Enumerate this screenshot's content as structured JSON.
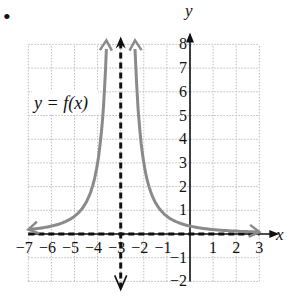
{
  "bullet": "•",
  "chart_data": {
    "type": "line",
    "title": "",
    "function_label": "y = f(x)",
    "xlabel": "x",
    "ylabel": "y",
    "xlim": [
      -7,
      3
    ],
    "ylim": [
      -2,
      8
    ],
    "grid": true,
    "x_ticks": [
      -7,
      -6,
      -5,
      -4,
      -3,
      -2,
      -1,
      1,
      2,
      3
    ],
    "y_ticks": [
      -2,
      -1,
      1,
      2,
      3,
      4,
      5,
      6,
      7,
      8
    ],
    "x_tick_labels": [
      "−7",
      "−6",
      "−5",
      "−4",
      "−3",
      "−2",
      "−1",
      "1",
      "2",
      "3"
    ],
    "y_tick_labels": [
      "−2",
      "−1",
      "1",
      "2",
      "3",
      "4",
      "5",
      "6",
      "7",
      "8"
    ],
    "asymptotes": [
      {
        "type": "vertical",
        "x": -3,
        "style": "dashed"
      },
      {
        "type": "horizontal",
        "y": 0,
        "style": "dashed"
      }
    ],
    "series": [
      {
        "name": "f(x) left branch",
        "x": [
          -7,
          -6,
          -5,
          -4.5,
          -4,
          -3.8,
          -3.6
        ],
        "y": [
          0.19,
          0.33,
          0.75,
          1.33,
          3,
          4.7,
          8.3
        ]
      },
      {
        "name": "f(x) right branch",
        "x": [
          -2.4,
          -2.2,
          -2,
          -1.5,
          -1,
          0,
          1,
          2,
          3
        ],
        "y": [
          8.3,
          4.7,
          3,
          1.33,
          0.75,
          0.33,
          0.19,
          0.12,
          0.08
        ]
      }
    ],
    "colors": {
      "curve": "#8a8a8a",
      "axis": "#111111",
      "grid": "#bbbbbb",
      "asymptote": "#111111"
    }
  }
}
